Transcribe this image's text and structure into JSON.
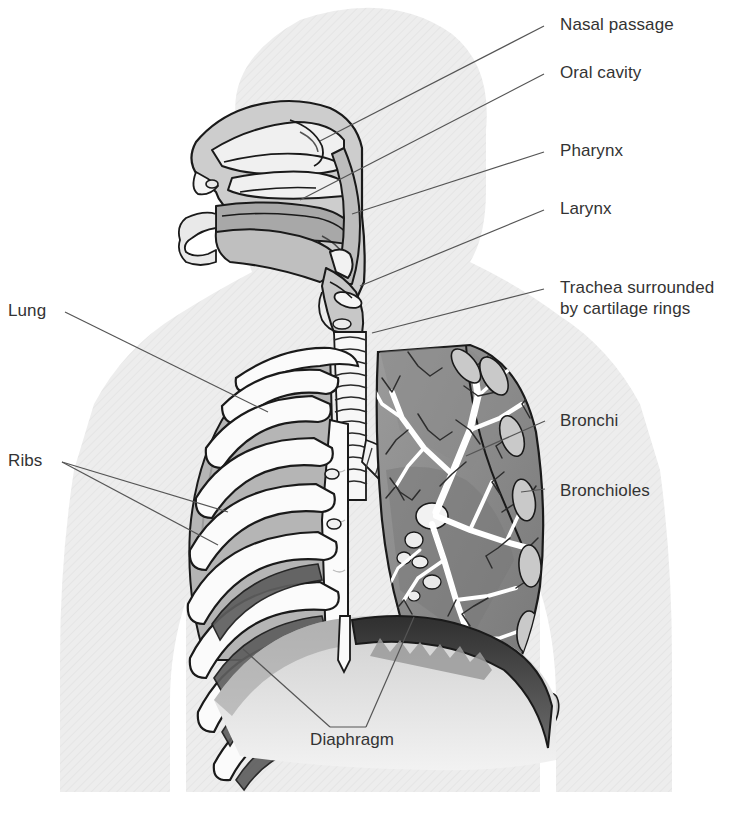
{
  "diagram": {
    "type": "anatomical-illustration",
    "view": "anterior thorax with sagittal head section",
    "background_color": "#ffffff",
    "body_silhouette_color": "#ebebeb",
    "leader_line_color": "#555555",
    "label_color": "#333333",
    "outline_color": "#1a1a1a",
    "tones": {
      "bone_white": "#fbfbfb",
      "lung_left_gray": "#b5b5b5",
      "lung_right_gray": "#8f8f8f",
      "lung_dark_gray": "#6e6e6e",
      "diaphragm_dark": "#3a3a3a",
      "cavity_gray": "#a8a8a8"
    }
  },
  "labels": [
    {
      "id": "nasal-passage",
      "text": "Nasal passage",
      "x": 560,
      "y": 14,
      "line": [
        544,
        26,
        320,
        141
      ]
    },
    {
      "id": "oral-cavity",
      "text": "Oral cavity",
      "x": 560,
      "y": 62,
      "line": [
        544,
        74,
        300,
        200
      ]
    },
    {
      "id": "pharynx",
      "text": "Pharynx",
      "x": 560,
      "y": 140,
      "line": [
        544,
        152,
        352,
        214
      ]
    },
    {
      "id": "larynx",
      "text": "Larynx",
      "x": 560,
      "y": 198,
      "line": [
        544,
        210,
        360,
        286
      ]
    },
    {
      "id": "trachea",
      "text": "Trachea surrounded",
      "x": 560,
      "y": 277,
      "line": [
        544,
        289,
        372,
        333
      ],
      "text2": "by cartilage rings",
      "y2": 298
    },
    {
      "id": "bronchi",
      "text": "Bronchi",
      "x": 560,
      "y": 410,
      "line": [
        545,
        421,
        466,
        456
      ]
    },
    {
      "id": "bronchioles",
      "text": "Bronchioles",
      "x": 560,
      "y": 480,
      "line": [
        545,
        489,
        521,
        492
      ]
    },
    {
      "id": "lung",
      "text": "Lung",
      "x": 8,
      "y": 300,
      "line": [
        65,
        312,
        268,
        412
      ]
    },
    {
      "id": "ribs",
      "text": "Ribs",
      "x": 8,
      "y": 450,
      "line": [
        62,
        462,
        228,
        512
      ],
      "line2": [
        62,
        462,
        218,
        545
      ]
    },
    {
      "id": "diaphragm",
      "text": "Diaphragm",
      "x": 310,
      "y": 729,
      "line": [
        330,
        727,
        243,
        649
      ],
      "line2": [
        366,
        727,
        414,
        617
      ]
    }
  ],
  "structures": [
    {
      "name": "nasal-cavity",
      "label": "Nasal passage"
    },
    {
      "name": "oral-cavity",
      "label": "Oral cavity"
    },
    {
      "name": "pharynx",
      "label": "Pharynx"
    },
    {
      "name": "larynx",
      "label": "Larynx"
    },
    {
      "name": "trachea",
      "label": "Trachea surrounded by cartilage rings"
    },
    {
      "name": "left-lung-ribcage",
      "label": "Lung"
    },
    {
      "name": "ribs",
      "label": "Ribs"
    },
    {
      "name": "bronchi",
      "label": "Bronchi"
    },
    {
      "name": "bronchioles",
      "label": "Bronchioles"
    },
    {
      "name": "diaphragm",
      "label": "Diaphragm"
    }
  ]
}
